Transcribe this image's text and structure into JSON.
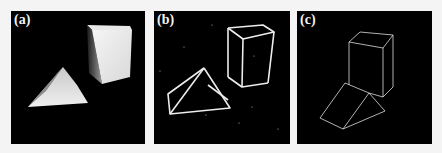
{
  "figure": {
    "panels": [
      {
        "id": "a",
        "label": "(a)",
        "content": "grayscale photograph of a rectangular box and a triangular prism on a black background"
      },
      {
        "id": "b",
        "label": "(b)",
        "content": "detected edge map of the box and triangular prism (thick white lines, noisy)"
      },
      {
        "id": "c",
        "label": "(c)",
        "content": "clean line drawing of box and triangular prism (thin white lines)"
      }
    ]
  },
  "colors": {
    "panel_background": "#000000",
    "page_background": "#f4f4f4",
    "line": "#f0f0f0"
  }
}
